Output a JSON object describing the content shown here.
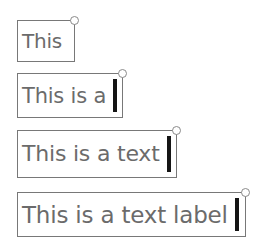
{
  "canvas": {
    "width": 263,
    "height": 249,
    "background_color": "#ffffff"
  },
  "style": {
    "text_color": "#6b6b6b",
    "border_color": "#787878",
    "caret_color": "#151515",
    "handle_stroke_color": "#8a8a8a",
    "handle_fill_color": "#ffffff",
    "box_fill_color": "#ffffff"
  },
  "labels": [
    {
      "text": "This",
      "caret_visible": false,
      "handle_visible": true,
      "handle_position": "top-right"
    },
    {
      "text": "This is a",
      "caret_visible": true,
      "handle_visible": true,
      "handle_position": "top-right"
    },
    {
      "text": "This is a text",
      "caret_visible": true,
      "handle_visible": true,
      "handle_position": "top-right"
    },
    {
      "text": "This is a text label",
      "caret_visible": true,
      "handle_visible": true,
      "handle_position": "top-right"
    }
  ]
}
